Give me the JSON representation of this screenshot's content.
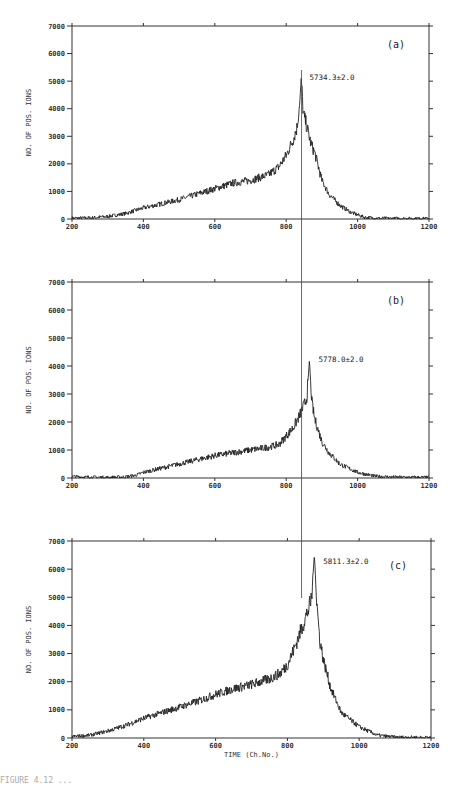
{
  "figure": {
    "xlabel": "TIME (Ch.No.)",
    "ylabel": "NO. OF POS. IONS",
    "caption_partial": "FIGURE 4.12 ..."
  },
  "chart_data": [
    {
      "type": "line",
      "panel": "(a)",
      "annotation": "5734.3±2.0",
      "xlabel": "",
      "ylabel": "NO. OF POS. IONS",
      "xlim": [
        200,
        1200
      ],
      "ylim": [
        0,
        7000
      ],
      "xticks": [
        200,
        400,
        600,
        800,
        1000,
        1200
      ],
      "yticks": [
        0,
        1000,
        2000,
        3000,
        4000,
        5000,
        6000,
        7000
      ],
      "peak": {
        "x": 840,
        "y": 5100
      },
      "x": [
        200,
        250,
        300,
        350,
        400,
        450,
        500,
        550,
        600,
        650,
        700,
        750,
        780,
        800,
        820,
        830,
        838,
        842,
        848,
        855,
        870,
        880,
        900,
        920,
        950,
        980,
        1000,
        1020,
        1050,
        1100,
        1200
      ],
      "y": [
        30,
        40,
        90,
        200,
        400,
        550,
        700,
        900,
        1100,
        1300,
        1400,
        1600,
        1900,
        2300,
        2900,
        3300,
        4200,
        5100,
        3800,
        3500,
        2700,
        2400,
        1400,
        900,
        500,
        250,
        150,
        60,
        30,
        20,
        20
      ]
    },
    {
      "type": "line",
      "panel": "(b)",
      "annotation": "5778.0±2.0",
      "xlabel": "",
      "ylabel": "NO. OF POS. IONS",
      "xlim": [
        200,
        1200
      ],
      "ylim": [
        0,
        7000
      ],
      "xticks": [
        200,
        400,
        600,
        800,
        1000,
        1200
      ],
      "yticks": [
        0,
        1000,
        2000,
        3000,
        4000,
        5000,
        6000,
        7000
      ],
      "peak": {
        "x": 865,
        "y": 4200
      },
      "x": [
        200,
        250,
        300,
        350,
        380,
        400,
        450,
        500,
        550,
        600,
        650,
        700,
        750,
        780,
        800,
        820,
        840,
        850,
        858,
        865,
        872,
        880,
        900,
        920,
        950,
        1000,
        1050,
        1100,
        1200
      ],
      "y": [
        50,
        30,
        20,
        40,
        100,
        200,
        350,
        500,
        650,
        800,
        900,
        1000,
        1100,
        1200,
        1500,
        1800,
        2300,
        2600,
        2900,
        4200,
        2700,
        2100,
        1300,
        900,
        500,
        200,
        60,
        30,
        20
      ]
    },
    {
      "type": "line",
      "panel": "(c)",
      "annotation": "5811.3±2.0",
      "xlabel": "TIME (Ch.No.)",
      "ylabel": "NO. OF POS. IONS",
      "xlim": [
        200,
        1200
      ],
      "ylim": [
        0,
        7000
      ],
      "xticks": [
        200,
        400,
        600,
        800,
        1000,
        1200
      ],
      "yticks": [
        0,
        1000,
        2000,
        3000,
        4000,
        5000,
        6000,
        7000
      ],
      "peak": {
        "x": 875,
        "y": 6550
      },
      "x": [
        200,
        250,
        300,
        350,
        400,
        450,
        500,
        550,
        600,
        650,
        700,
        750,
        780,
        800,
        820,
        840,
        860,
        868,
        875,
        882,
        890,
        900,
        920,
        950,
        1000,
        1050,
        1100,
        1200
      ],
      "y": [
        50,
        100,
        250,
        450,
        700,
        900,
        1100,
        1300,
        1550,
        1750,
        1900,
        2100,
        2300,
        2600,
        3200,
        3900,
        4600,
        5000,
        6550,
        4800,
        3500,
        2800,
        1800,
        900,
        400,
        100,
        30,
        20
      ]
    }
  ],
  "reference_line": {
    "x": 843,
    "label": "vertical alignment line through peak (a)"
  }
}
